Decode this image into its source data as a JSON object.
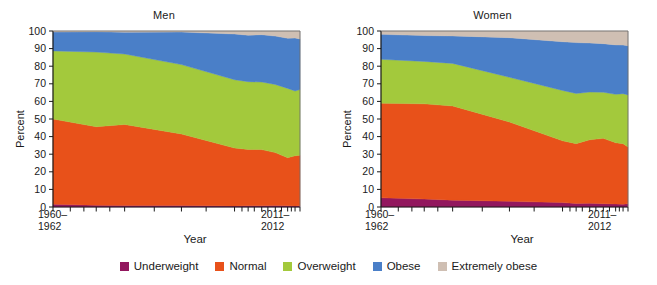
{
  "figure": {
    "background": "#ffffff",
    "panels": [
      "Men",
      "Women"
    ]
  },
  "axes": {
    "ylabel": "Percent",
    "xlabel": "Year",
    "ytick_labels": [
      "0",
      "10",
      "20",
      "30",
      "40",
      "50",
      "60",
      "70",
      "80",
      "90",
      "100"
    ],
    "xtick_first_line1": "1960–",
    "xtick_first_line2": "1962",
    "xtick_last_line1": "2011–",
    "xtick_last_line2": "2012"
  },
  "legend": {
    "items": [
      {
        "label": "Underweight",
        "color": "#92175E"
      },
      {
        "label": "Normal",
        "color": "#E8511A"
      },
      {
        "label": "Overweight",
        "color": "#A3C93C"
      },
      {
        "label": "Obese",
        "color": "#4A7FC8"
      },
      {
        "label": "Extremely obese",
        "color": "#CFBFB3"
      }
    ]
  },
  "chart_data": {
    "type": "area",
    "stacked": true,
    "stack_total": 100,
    "xlabel": "Year",
    "ylabel": "Percent",
    "ylim": [
      0,
      100
    ],
    "ytick_step": 10,
    "grid": false,
    "legend_position": "bottom",
    "x": [
      "1960-1962",
      "1971-1974",
      "1976-1980",
      "1988-1994",
      "1999-2000",
      "2001-2002",
      "2003-2004",
      "2005-2006",
      "2007-2008",
      "2009-2010",
      "2011-2012"
    ],
    "x_positions": [
      0,
      17.5,
      29,
      52,
      73.5,
      79,
      84.5,
      90,
      95,
      98,
      100
    ],
    "charts": [
      {
        "panel": "Men",
        "series": [
          {
            "name": "Underweight",
            "color": "#92175E",
            "values": [
              1.6,
              1.0,
              0.8,
              0.9,
              0.6,
              0.7,
              0.7,
              0.8,
              0.7,
              0.6,
              0.7
            ]
          },
          {
            "name": "Normal",
            "color": "#E8511A",
            "values": [
              48.4,
              44.6,
              46.1,
              40.6,
              32.9,
              32.0,
              31.9,
              30.1,
              27.3,
              28.5,
              28.7
            ]
          },
          {
            "name": "Overweight",
            "color": "#A3C93C",
            "values": [
              38.7,
              42.4,
              40.0,
              39.4,
              38.8,
              38.5,
              38.4,
              38.7,
              39.4,
              36.8,
              37.3
            ]
          },
          {
            "name": "Obese",
            "color": "#4A7FC8",
            "values": [
              10.7,
              11.6,
              12.4,
              18.5,
              26.0,
              26.4,
              26.9,
              27.5,
              28.5,
              30.1,
              28.8
            ]
          },
          {
            "name": "Extremely obese",
            "color": "#CFBFB3",
            "values": [
              0.6,
              0.4,
              0.7,
              0.6,
              1.7,
              2.4,
              2.1,
              2.9,
              4.1,
              4.0,
              4.5
            ]
          }
        ]
      },
      {
        "panel": "Women",
        "series": [
          {
            "name": "Underweight",
            "color": "#92175E",
            "values": [
              5.2,
              4.5,
              3.9,
              3.2,
              2.5,
              2.0,
              2.1,
              1.9,
              1.7,
              1.6,
              1.8
            ]
          },
          {
            "name": "Normal",
            "color": "#E8511A",
            "values": [
              53.8,
              54.1,
              53.5,
              45.1,
              35.1,
              34.0,
              36.1,
              37.1,
              34.8,
              34.4,
              32.3
            ]
          },
          {
            "name": "Overweight",
            "color": "#A3C93C",
            "values": [
              24.9,
              24.1,
              24.2,
              25.4,
              28.6,
              28.5,
              27.1,
              26.2,
              27.5,
              28.4,
              29.6
            ]
          },
          {
            "name": "Obese",
            "color": "#4A7FC8",
            "values": [
              14.2,
              14.7,
              15.6,
              22.5,
              27.7,
              28.9,
              27.9,
              27.6,
              28.1,
              27.6,
              27.9
            ]
          },
          {
            "name": "Extremely obese",
            "color": "#CFBFB3",
            "values": [
              1.9,
              2.6,
              2.8,
              3.8,
              6.1,
              6.6,
              6.8,
              7.2,
              7.9,
              8.0,
              8.4
            ]
          }
        ]
      }
    ]
  },
  "plot_geometry": {
    "xtick_fractions": [
      0,
      7,
      12.5,
      17.5,
      23,
      29,
      41,
      52,
      62,
      73.5,
      76.5,
      79,
      81.5,
      84.5,
      87,
      90,
      92.5,
      95,
      96.5,
      98,
      100
    ]
  }
}
